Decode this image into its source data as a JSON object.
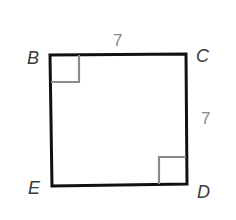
{
  "diagram": {
    "shape": "square",
    "vertices": {
      "B": "B",
      "C": "C",
      "D": "D",
      "E": "E"
    },
    "side_lengths": {
      "BC": "7",
      "CD": "7"
    },
    "right_angles": [
      "B",
      "D"
    ],
    "colors": {
      "outline": "#111111",
      "marker": "#8a8a8a",
      "label": "#3a3a3a",
      "length_label": "#8a8a8a"
    }
  }
}
